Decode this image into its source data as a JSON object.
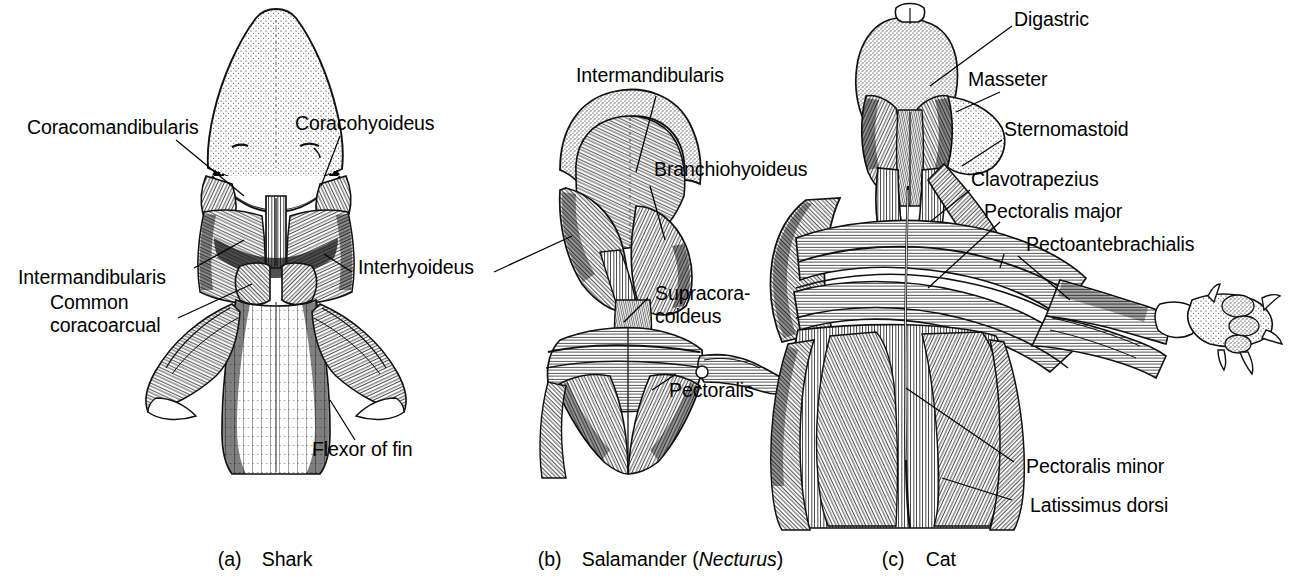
{
  "figure": {
    "type": "comparative-anatomy-illustration",
    "background_color": "#ffffff",
    "ink_color": "#000000"
  },
  "panels": [
    {
      "id": "a",
      "caption_tag": "(a)",
      "caption_name": "Shark",
      "caption_italic": "",
      "labels": [
        "Coracomandibularis",
        "Coracohyoideus",
        "Intermandibularis",
        "Common",
        "coracoarcual",
        "Interhyoideus",
        "Flexor of fin"
      ]
    },
    {
      "id": "b",
      "caption_tag": "(b)",
      "caption_name": "Salamander (",
      "caption_italic": "Necturus",
      "caption_close": ")",
      "labels": [
        "Intermandibularis",
        "Branchiohyoideus",
        "Supracora-",
        "coideus",
        "Pectoralis"
      ]
    },
    {
      "id": "c",
      "caption_tag": "(c)",
      "caption_name": "Cat",
      "caption_italic": "",
      "labels": [
        "Digastric",
        "Masseter",
        "Sternomastoid",
        "Clavotrapezius",
        "Pectoralis major",
        "Pectoantebrachialis",
        "Pectoralis minor",
        "Latissimus dorsi"
      ]
    }
  ],
  "labels": {
    "shark": {
      "coracomandibularis": "Coracomandibularis",
      "coracohyoideus": "Coracohyoideus",
      "intermandibularis": "Intermandibularis",
      "common": "Common",
      "coracoarcual": "coracoarcual",
      "interhyoideus": "Interhyoideus",
      "flexor_of_fin": "Flexor of fin"
    },
    "salamander": {
      "intermandibularis": "Intermandibularis",
      "branchiohyoideus": "Branchiohyoideus",
      "supracora": "Supracora-",
      "coideus": "coideus",
      "pectoralis": "Pectoralis"
    },
    "cat": {
      "digastric": "Digastric",
      "masseter": "Masseter",
      "sternomastoid": "Sternomastoid",
      "clavotrapezius": "Clavotrapezius",
      "pectoralis_major": "Pectoralis major",
      "pectoantebrachialis": "Pectoantebrachialis",
      "pectoralis_minor": "Pectoralis minor",
      "latissimus_dorsi": "Latissimus dorsi"
    }
  },
  "captions": {
    "a_tag": "(a)",
    "a_text": "Shark",
    "b_tag": "(b)",
    "b_text_pre": "Salamander (",
    "b_text_italic": "Necturus",
    "b_text_post": ")",
    "c_tag": "(c)",
    "c_text": "Cat"
  }
}
